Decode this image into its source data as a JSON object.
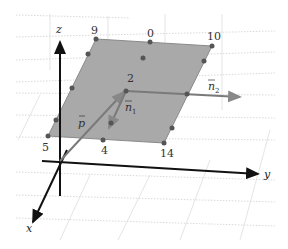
{
  "diagram": {
    "type": "3d-plane-vectors",
    "axes": {
      "x": "x",
      "y": "y",
      "z": "z"
    },
    "plane_corners": [
      {
        "label": "9",
        "x": 96,
        "y": 39
      },
      {
        "label": "10",
        "x": 212,
        "y": 46
      },
      {
        "label": "14",
        "x": 164,
        "y": 143
      },
      {
        "label": "5",
        "x": 48,
        "y": 136
      }
    ],
    "points": [
      {
        "label": "0",
        "x": 150,
        "y": 42
      },
      {
        "label": "2",
        "x": 126,
        "y": 91
      }
    ],
    "point_labels": {
      "p9": "9",
      "p0": "0",
      "p10": "10",
      "p2": "2",
      "p5": "5",
      "p4": "4",
      "p14": "14"
    },
    "vectors": {
      "p": "p",
      "n1": "n",
      "n1_sub": "1",
      "n2": "n",
      "n2_sub": "2"
    },
    "colors": {
      "plane_fill": "#a8a8a8",
      "plane_edge": "#888888",
      "axis": "#111111",
      "vector": "#777777",
      "point": "#555555",
      "grid": "#d0d0d0"
    }
  }
}
